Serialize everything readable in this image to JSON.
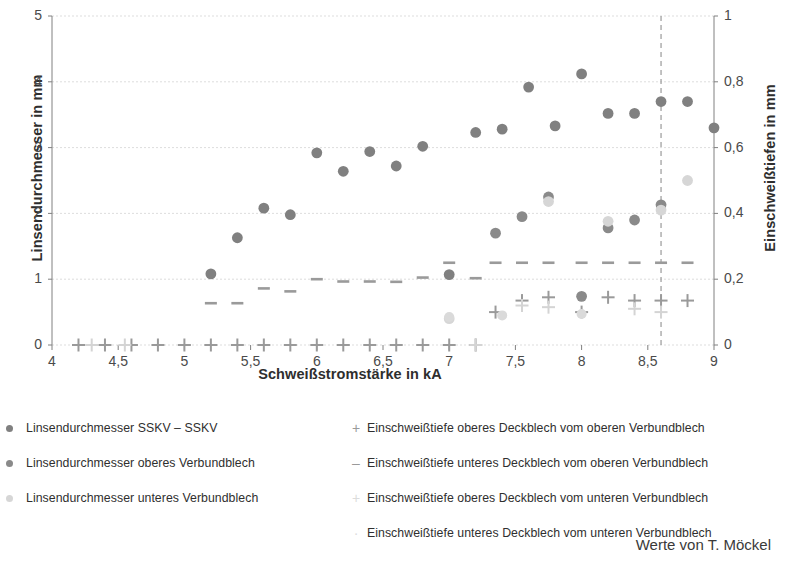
{
  "chart_data": {
    "type": "scatter",
    "title": "",
    "xlabel": "Schweißstromstärke in kA",
    "ylabel": "Linsendurchmesser in mm",
    "y2label": "Einschweißtiefen in mm",
    "xlim": [
      4,
      9
    ],
    "ylim": [
      0,
      5
    ],
    "y2lim": [
      0,
      1
    ],
    "xticks": [
      "4",
      "4,5",
      "5",
      "5,5",
      "6",
      "6,5",
      "7",
      "7,5",
      "8",
      "8,5",
      "9"
    ],
    "xtick_values": [
      4,
      4.5,
      5,
      5.5,
      6,
      6.5,
      7,
      7.5,
      8,
      8.5,
      9
    ],
    "yticks_left": [
      "0",
      "1",
      "2",
      "3",
      "4",
      "5"
    ],
    "ytick_left_values": [
      0,
      1,
      2,
      3,
      4,
      5
    ],
    "yticks_right": [
      "0",
      "0,2",
      "0,4",
      "0,6",
      "0,8",
      "1"
    ],
    "ytick_right_values": [
      0,
      0.2,
      0.4,
      0.6,
      0.8,
      1
    ],
    "grid": true,
    "legend_position": "below",
    "annotations": [
      {
        "type": "vline",
        "x": 8.6,
        "style": "dashed",
        "color": "#9a9a9a"
      }
    ],
    "series": [
      {
        "name": "Linsendurchmesser SSKV – SSKV",
        "axis": "left",
        "marker": "circle",
        "color": "#808080",
        "points": [
          [
            5.2,
            1.08
          ],
          [
            5.4,
            1.63
          ],
          [
            5.6,
            2.08
          ],
          [
            5.8,
            1.98
          ],
          [
            6.0,
            2.92
          ],
          [
            6.2,
            2.64
          ],
          [
            6.4,
            2.94
          ],
          [
            6.6,
            2.72
          ],
          [
            6.8,
            3.02
          ],
          [
            7.0,
            1.07
          ],
          [
            7.2,
            3.23
          ],
          [
            7.4,
            3.28
          ],
          [
            7.6,
            3.92
          ],
          [
            7.8,
            3.33
          ],
          [
            8.0,
            4.12
          ],
          [
            8.2,
            3.52
          ],
          [
            8.4,
            3.52
          ],
          [
            8.6,
            3.7
          ],
          [
            8.8,
            3.7
          ],
          [
            9.0,
            3.3
          ]
        ]
      },
      {
        "name": "Linsendurchmesser oberes Verbundblech",
        "axis": "left",
        "marker": "circle",
        "color": "#8a8a8a",
        "points": [
          [
            7.35,
            1.7
          ],
          [
            7.55,
            1.95
          ],
          [
            7.75,
            2.25
          ],
          [
            8.0,
            0.74
          ],
          [
            8.2,
            1.78
          ],
          [
            8.4,
            1.9
          ],
          [
            8.6,
            2.13
          ]
        ]
      },
      {
        "name": "Linsendurchmesser unteres Verbundblech",
        "axis": "left",
        "marker": "circle",
        "color": "#d6d6d6",
        "points": [
          [
            7.0,
            0.4
          ],
          [
            7.75,
            2.18
          ],
          [
            8.2,
            1.88
          ],
          [
            8.6,
            2.05
          ],
          [
            8.8,
            2.5
          ]
        ]
      },
      {
        "name": "Einschweißtiefe oberes Deckblech vom oberen Verbundblech",
        "axis": "right",
        "marker": "plus",
        "color": "#9a9a9a",
        "points": [
          [
            4.2,
            0.0
          ],
          [
            4.4,
            0.0
          ],
          [
            4.6,
            0.0
          ],
          [
            4.8,
            0.0
          ],
          [
            5.0,
            0.0
          ],
          [
            5.2,
            0.0
          ],
          [
            5.4,
            0.0
          ],
          [
            5.6,
            0.0
          ],
          [
            5.8,
            0.0
          ],
          [
            6.0,
            0.0
          ],
          [
            6.2,
            0.0
          ],
          [
            6.4,
            0.0
          ],
          [
            6.6,
            0.0
          ],
          [
            6.8,
            0.0
          ],
          [
            7.0,
            0.0
          ],
          [
            7.2,
            0.0
          ],
          [
            7.35,
            0.1
          ],
          [
            7.55,
            0.135
          ],
          [
            7.75,
            0.145
          ],
          [
            8.0,
            0.1
          ],
          [
            8.2,
            0.145
          ],
          [
            8.4,
            0.135
          ],
          [
            8.6,
            0.135
          ],
          [
            8.8,
            0.135
          ]
        ]
      },
      {
        "name": "Einschweißtiefe unteres Deckblech vom oberen Verbundblech",
        "axis": "right",
        "marker": "dash",
        "color": "#9a9a9a",
        "points": [
          [
            5.2,
            0.127
          ],
          [
            5.4,
            0.127
          ],
          [
            5.6,
            0.172
          ],
          [
            5.8,
            0.163
          ],
          [
            6.0,
            0.2
          ],
          [
            6.2,
            0.193
          ],
          [
            6.4,
            0.193
          ],
          [
            6.6,
            0.192
          ],
          [
            6.8,
            0.205
          ],
          [
            7.0,
            0.25
          ],
          [
            7.2,
            0.203
          ],
          [
            7.35,
            0.25
          ],
          [
            7.55,
            0.25
          ],
          [
            7.75,
            0.25
          ],
          [
            8.0,
            0.25
          ],
          [
            8.2,
            0.25
          ],
          [
            8.4,
            0.25
          ],
          [
            8.6,
            0.25
          ],
          [
            8.8,
            0.25
          ]
        ]
      },
      {
        "name": "Einschweißtiefe oberes Deckblech vom unteren Verbundblech",
        "axis": "right",
        "marker": "plus-light",
        "color": "#d4d4d4",
        "points": [
          [
            4.3,
            0.0
          ],
          [
            4.55,
            0.0
          ],
          [
            7.2,
            0.0
          ],
          [
            7.55,
            0.12
          ],
          [
            7.75,
            0.115
          ],
          [
            8.4,
            0.11
          ],
          [
            8.6,
            0.1
          ]
        ]
      },
      {
        "name": "Einschweißtiefe unteres Deckblech vom unteren Verbundblech",
        "axis": "right",
        "marker": "dot-light",
        "color": "#dadada",
        "points": [
          [
            7.0,
            0.085
          ],
          [
            7.4,
            0.09
          ],
          [
            8.0,
            0.094
          ]
        ]
      }
    ]
  },
  "legend": {
    "left": [
      {
        "label": "Linsendurchmesser SSKV – SSKV",
        "marker": "circle",
        "color": "#808080"
      },
      {
        "label": "Linsendurchmesser oberes Verbundblech",
        "marker": "circle",
        "color": "#8a8a8a"
      },
      {
        "label": "Linsendurchmesser unteres Verbundblech",
        "marker": "circle",
        "color": "#d6d6d6"
      }
    ],
    "right": [
      {
        "label": "Einschweißtiefe oberes Deckblech vom oberen Verbundblech",
        "marker": "plus",
        "color": "#9a9a9a",
        "glyph": "+"
      },
      {
        "label": "Einschweißtiefe unteres Deckblech vom oberen Verbundblech",
        "marker": "dash",
        "color": "#9a9a9a",
        "glyph": "–"
      },
      {
        "label": "Einschweißtiefe oberes Deckblech vom unteren Verbundblech",
        "marker": "plus-light",
        "color": "#dcdcdc",
        "glyph": "+"
      },
      {
        "label": "Einschweißtiefe unteres Deckblech vom unteren Verbundblech",
        "marker": "dot-light",
        "color": "#dcdcdc",
        "glyph": "·"
      }
    ]
  },
  "credit": "Werte von T. Möckel",
  "colors": {
    "axis": "#808080",
    "grid": "#d9d9d9",
    "text": "#3a3a3a",
    "series_dark": "#808080",
    "series_light": "#d6d6d6"
  }
}
